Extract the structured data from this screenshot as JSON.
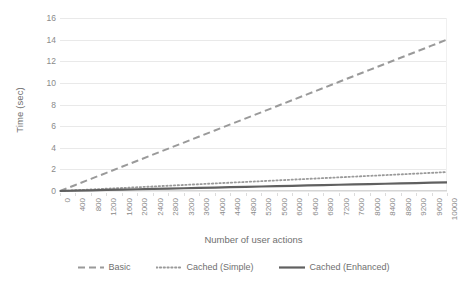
{
  "chart_data": {
    "type": "line",
    "title": "",
    "xlabel": "Number of user actions",
    "ylabel": "Time (sec)",
    "xlim": [
      0,
      10000
    ],
    "ylim": [
      0,
      16
    ],
    "grid": true,
    "legend_position": "bottom",
    "x_ticks": [
      0,
      400,
      800,
      1200,
      1600,
      2000,
      2400,
      2800,
      3200,
      3600,
      4000,
      4400,
      4800,
      5200,
      5600,
      6000,
      6400,
      6800,
      7200,
      7600,
      8000,
      8400,
      8800,
      9200,
      9600,
      10000
    ],
    "y_ticks": [
      0,
      2,
      4,
      6,
      8,
      10,
      12,
      14,
      16
    ],
    "x": [
      0,
      400,
      800,
      1200,
      1600,
      2000,
      2400,
      2800,
      3200,
      3600,
      4000,
      4400,
      4800,
      5200,
      5600,
      6000,
      6400,
      6800,
      7200,
      7600,
      8000,
      8400,
      8800,
      9200,
      9600,
      10000
    ],
    "series": [
      {
        "name": "Basic",
        "style": "dashed",
        "color": "#9a9a9a",
        "values": [
          0,
          0.56,
          1.12,
          1.68,
          2.24,
          2.8,
          3.36,
          3.92,
          4.48,
          5.04,
          5.6,
          6.16,
          6.72,
          7.28,
          7.84,
          8.4,
          8.96,
          9.52,
          10.08,
          10.64,
          11.2,
          11.76,
          12.32,
          12.88,
          13.44,
          14.0
        ]
      },
      {
        "name": "Cached (Simple)",
        "style": "dotted",
        "color": "#9a9a9a",
        "values": [
          0,
          0.07,
          0.14,
          0.21,
          0.28,
          0.35,
          0.42,
          0.49,
          0.56,
          0.63,
          0.7,
          0.77,
          0.84,
          0.91,
          0.98,
          1.05,
          1.12,
          1.19,
          1.26,
          1.33,
          1.4,
          1.47,
          1.54,
          1.61,
          1.68,
          1.75
        ]
      },
      {
        "name": "Cached (Enhanced)",
        "style": "solid",
        "color": "#606060",
        "values": [
          0,
          0.032,
          0.064,
          0.096,
          0.128,
          0.16,
          0.192,
          0.224,
          0.256,
          0.288,
          0.32,
          0.352,
          0.384,
          0.416,
          0.448,
          0.48,
          0.512,
          0.544,
          0.576,
          0.608,
          0.64,
          0.672,
          0.704,
          0.736,
          0.768,
          0.8
        ]
      }
    ]
  },
  "legend": {
    "items": [
      {
        "label": "Basic"
      },
      {
        "label": "Cached (Simple)"
      },
      {
        "label": "Cached (Enhanced)"
      }
    ]
  },
  "colors": {
    "gridline": "#e9e9e9",
    "axis": "#d6d6d6",
    "tick_text": "#8a8a8a",
    "title_text": "#6f6f6f",
    "background": "#ffffff"
  }
}
